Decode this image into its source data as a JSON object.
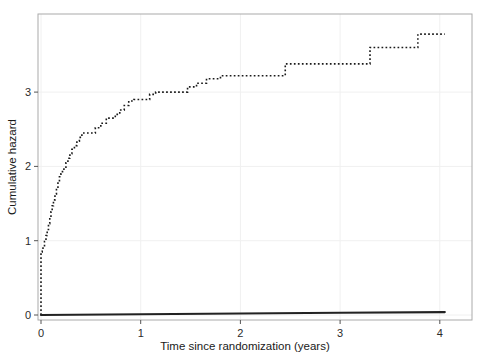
{
  "figure": {
    "name": "cumulative-hazard-plot",
    "background": "#ffffff"
  },
  "chart_data": {
    "type": "line",
    "title": "",
    "subtitle": "",
    "xlabel": "Time since randomization (years)",
    "ylabel": "Cumulative hazard",
    "xlim": [
      0,
      4.35
    ],
    "ylim": [
      0,
      4.1
    ],
    "xticks": [
      0,
      1,
      2,
      3,
      4
    ],
    "xticklabels": [
      "0",
      "1",
      "2",
      "3",
      "4"
    ],
    "yticks": [
      0,
      1,
      2,
      3
    ],
    "yticklabels": [
      "0",
      "1",
      "2",
      "3"
    ],
    "grid": true,
    "grid_color": "#f0f0f0",
    "legend": "none",
    "step_shape": "hv",
    "frame_color": "#aaaaaa",
    "series": [
      {
        "name": "treatment-arm-dotted",
        "style": "dotted",
        "color": "#1a1a1a",
        "linewidth": 1.6,
        "x": [
          0.0,
          0.012,
          0.02,
          0.035,
          0.05,
          0.062,
          0.075,
          0.088,
          0.1,
          0.112,
          0.125,
          0.14,
          0.155,
          0.17,
          0.185,
          0.2,
          0.215,
          0.23,
          0.25,
          0.27,
          0.29,
          0.31,
          0.335,
          0.36,
          0.385,
          0.41,
          0.44,
          0.47,
          0.5,
          0.545,
          0.6,
          0.655,
          0.7,
          0.745,
          0.79,
          0.835,
          0.88,
          0.93,
          0.98,
          1.03,
          1.09,
          1.15,
          1.22,
          1.3,
          1.38,
          1.47,
          1.56,
          1.66,
          1.8,
          2.05,
          2.23,
          2.32,
          2.45,
          3.12,
          3.3,
          3.78,
          4.05
        ],
        "y": [
          0.0,
          0.85,
          0.88,
          0.92,
          0.99,
          1.07,
          1.15,
          1.23,
          1.31,
          1.39,
          1.47,
          1.55,
          1.63,
          1.71,
          1.79,
          1.86,
          1.9,
          1.93,
          1.99,
          2.05,
          2.11,
          2.17,
          2.23,
          2.28,
          2.34,
          2.39,
          2.45,
          2.45,
          2.45,
          2.45,
          2.52,
          2.58,
          2.65,
          2.65,
          2.7,
          2.76,
          2.82,
          2.88,
          2.9,
          2.9,
          2.9,
          2.97,
          3.0,
          3.0,
          3.0,
          3.0,
          3.07,
          3.12,
          3.18,
          3.22,
          3.22,
          3.22,
          3.22,
          3.38,
          3.38,
          3.6,
          3.78
        ]
      },
      {
        "name": "control-arm-solid",
        "style": "solid",
        "color": "#222222",
        "linewidth": 2.2,
        "x": [
          0.0,
          1.0,
          2.0,
          3.0,
          4.05
        ],
        "y": [
          0.0,
          0.01,
          0.02,
          0.03,
          0.04
        ]
      }
    ]
  }
}
